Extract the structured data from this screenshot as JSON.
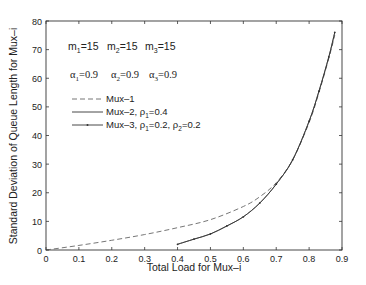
{
  "chart_data": {
    "type": "line",
    "title": "",
    "xlabel": "Total Load for Mux–i",
    "ylabel": "Standard Deviation of Queue Length for Mux–i",
    "xlim": [
      0,
      0.9
    ],
    "ylim": [
      0,
      80
    ],
    "xticks": [
      0,
      0.1,
      0.2,
      0.3,
      0.4,
      0.5,
      0.6,
      0.7,
      0.8,
      0.9
    ],
    "xtick_labels": [
      "0",
      "0.1",
      "0.2",
      "0.3",
      "0.4",
      "0.5",
      "0.6",
      "0.7",
      "0.8",
      "0.9"
    ],
    "yticks": [
      0,
      10,
      20,
      30,
      40,
      50,
      60,
      70,
      80
    ],
    "ytick_labels": [
      "0",
      "10",
      "20",
      "30",
      "40",
      "50",
      "60",
      "70",
      "80"
    ],
    "grid": false,
    "legend_position": "upper left",
    "annotations": [
      {
        "text": "m1=15   m2=15   m3=15",
        "x": 0.05,
        "y": 70
      },
      {
        "text": "α1=0.9   α2=0.9   α3=0.9",
        "x": 0.05,
        "y": 60
      }
    ],
    "series": [
      {
        "name": "Mux–1",
        "style": "dashed",
        "x": [
          0.0,
          0.1,
          0.2,
          0.3,
          0.4,
          0.5,
          0.6,
          0.65,
          0.7,
          0.75,
          0.8,
          0.83,
          0.86,
          0.878
        ],
        "y": [
          0.0,
          1.6,
          3.4,
          5.4,
          7.8,
          10.6,
          15.2,
          18.6,
          23.5,
          31.5,
          44.5,
          55.0,
          67.0,
          75.0
        ]
      },
      {
        "name": "Mux–2,  ρ1=0.4",
        "style": "solid",
        "x": [
          0.4,
          0.45,
          0.5,
          0.55,
          0.6,
          0.65,
          0.7,
          0.75,
          0.8,
          0.83,
          0.86,
          0.878
        ],
        "y": [
          2.0,
          3.8,
          5.6,
          8.4,
          11.6,
          16.4,
          23.0,
          31.5,
          45.0,
          55.5,
          67.5,
          76.0
        ]
      },
      {
        "name": "Mux–3,  ρ1=0.2, ρ2=0.2",
        "style": "solid-dot",
        "x": [
          0.4,
          0.45,
          0.5,
          0.55,
          0.6,
          0.65,
          0.7,
          0.75,
          0.8,
          0.83,
          0.86,
          0.878
        ],
        "y": [
          2.0,
          3.8,
          5.6,
          8.4,
          11.6,
          16.4,
          23.0,
          31.5,
          45.0,
          55.5,
          67.5,
          76.0
        ]
      }
    ]
  },
  "legend": {
    "items": [
      {
        "label": "Mux–1",
        "sub": ""
      },
      {
        "label": "Mux–2,  ρ",
        "sub": "1",
        "after": "=0.4"
      },
      {
        "label": "Mux–3,  ρ",
        "sub": "1",
        "after": "=0.2, ρ",
        "sub2": "2",
        "after2": "=0.2"
      }
    ]
  },
  "annotation_params": {
    "m": [
      {
        "sym": "m",
        "sub": "1",
        "val": "=15"
      },
      {
        "sym": "m",
        "sub": "2",
        "val": "=15"
      },
      {
        "sym": "m",
        "sub": "3",
        "val": "=15"
      }
    ],
    "alpha": [
      {
        "sym": "α",
        "sub": "1",
        "val": "=0.9"
      },
      {
        "sym": "α",
        "sub": "2",
        "val": "=0.9"
      },
      {
        "sym": "α",
        "sub": "3",
        "val": "=0.9"
      }
    ]
  },
  "colors": {
    "axis": "#333333",
    "line": "#333333",
    "dashed": "#666666"
  }
}
